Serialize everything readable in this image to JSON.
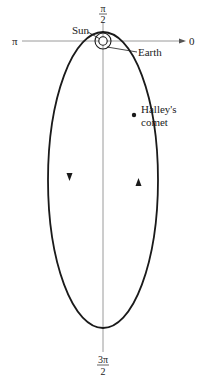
{
  "diagram": {
    "axis_labels": {
      "right": "0",
      "top_num": "π",
      "top_den": "2",
      "left": "π",
      "bottom_num": "3π",
      "bottom_den": "2"
    },
    "annotations": {
      "sun": "Sun",
      "earth": "Earth",
      "comet_line1": "Halley's",
      "comet_line2": "comet"
    },
    "colors": {
      "orbit": "#1a1a1a",
      "axis": "#9a9a9a",
      "text": "#222222"
    },
    "orbit_direction": "counterclockwise"
  }
}
